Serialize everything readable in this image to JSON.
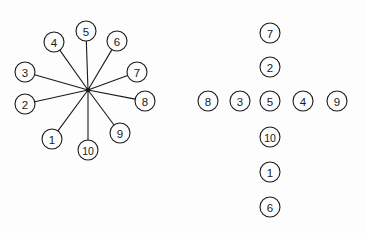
{
  "figure": {
    "background_color": "#fdfdfd",
    "stroke_color": "#1a1a1a",
    "node_fill": "#fdfdfd",
    "node_radius": 10,
    "panels": [
      {
        "name": "star-graph",
        "layout": "star",
        "hub": {
          "x": 88,
          "y": 90
        },
        "nodes": [
          {
            "label": "1",
            "x": 52,
            "y": 139
          },
          {
            "label": "2",
            "x": 25,
            "y": 104
          },
          {
            "label": "3",
            "x": 25,
            "y": 72
          },
          {
            "label": "4",
            "x": 54,
            "y": 42
          },
          {
            "label": "5",
            "x": 86,
            "y": 31
          },
          {
            "label": "6",
            "x": 117,
            "y": 41
          },
          {
            "label": "7",
            "x": 137,
            "y": 72
          },
          {
            "label": "8",
            "x": 145,
            "y": 101
          },
          {
            "label": "9",
            "x": 120,
            "y": 133
          },
          {
            "label": "10",
            "x": 88,
            "y": 150
          }
        ],
        "edges": [
          {
            "from": "hub",
            "to": "1"
          },
          {
            "from": "hub",
            "to": "2"
          },
          {
            "from": "hub",
            "to": "3"
          },
          {
            "from": "hub",
            "to": "4"
          },
          {
            "from": "hub",
            "to": "5"
          },
          {
            "from": "hub",
            "to": "6"
          },
          {
            "from": "hub",
            "to": "7"
          },
          {
            "from": "hub",
            "to": "8"
          },
          {
            "from": "hub",
            "to": "9"
          },
          {
            "from": "hub",
            "to": "10"
          }
        ]
      },
      {
        "name": "cross-layout",
        "layout": "cross",
        "nodes": [
          {
            "label": "7",
            "x": 270,
            "y": 33
          },
          {
            "label": "2",
            "x": 270,
            "y": 67
          },
          {
            "label": "8",
            "x": 208,
            "y": 101
          },
          {
            "label": "3",
            "x": 240,
            "y": 101
          },
          {
            "label": "5",
            "x": 270,
            "y": 101
          },
          {
            "label": "4",
            "x": 303,
            "y": 101
          },
          {
            "label": "9",
            "x": 337,
            "y": 101
          },
          {
            "label": "10",
            "x": 270,
            "y": 137
          },
          {
            "label": "1",
            "x": 270,
            "y": 172
          },
          {
            "label": "6",
            "x": 270,
            "y": 207
          }
        ],
        "edges": []
      }
    ]
  }
}
